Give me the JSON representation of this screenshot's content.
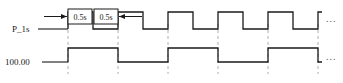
{
  "diagram": {
    "type": "timing-diagram",
    "signals": [
      {
        "name": "P_1s",
        "label": "P_1s",
        "row": "top",
        "description": "1 second period clock, 50% duty cycle",
        "level_high_y": 12,
        "level_low_y": 29,
        "first_edge_x": 68,
        "half_period_px": 25,
        "edges_x": [
          68,
          93,
          118,
          143,
          168,
          193,
          218,
          243,
          268,
          293,
          318
        ],
        "continuation": "..."
      },
      {
        "name": "100.00",
        "label": "100.00",
        "row": "bottom",
        "description": "divided-by-two signal, toggles each 1s",
        "level_high_y": 48,
        "level_low_y": 62,
        "first_edge_x": 68,
        "half_period_px": 50,
        "edges_x": [
          68,
          118,
          168,
          218,
          268,
          318
        ],
        "continuation": "..."
      }
    ],
    "dimensions": [
      {
        "text": "0.5s",
        "box_x": 68,
        "box_y": 9,
        "box_w": 24,
        "box_h": 15,
        "arrow": "right",
        "arrow_from_x": 44,
        "arrow_to_x": 67
      },
      {
        "text": "0.5s",
        "box_x": 94,
        "box_y": 9,
        "box_w": 24,
        "box_h": 15,
        "arrow": "left",
        "arrow_from_x": 142,
        "arrow_to_x": 119
      }
    ],
    "gridlines_x": [
      68,
      118,
      168,
      218,
      268,
      318
    ],
    "leader_lines": [
      {
        "signal": "P_1s",
        "from_x": 38,
        "to_x": 68,
        "y": 29
      },
      {
        "signal": "100.00",
        "from_x": 42,
        "to_x": 68,
        "y": 62
      }
    ],
    "ellipses": [
      {
        "text": "...",
        "x": 326,
        "y": 18
      },
      {
        "text": "...",
        "x": 326,
        "y": 56
      }
    ],
    "colors": {
      "waveform": "#1a1a1a",
      "gridline": "#9a9a9a",
      "text": "#1a1a1a",
      "background": "#ffffff"
    }
  }
}
